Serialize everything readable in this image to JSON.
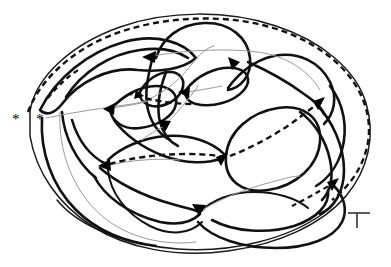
{
  "figure": {
    "caption": "",
    "background_color": "#ffffff",
    "width": 391,
    "height": 267
  },
  "palette": {
    "thick_stroke": "#111111",
    "thin_stroke": "#9a9a9a",
    "outline_stroke": "#1a1a1a",
    "dashed_stroke": "#111111",
    "arrow_fill": "#000000",
    "marker_color": "#000000",
    "t_marker_color": "#333333"
  },
  "markers": [
    {
      "id": "asterisk-outer-left",
      "label": "*",
      "x": 18,
      "y": 118,
      "size": 15
    },
    {
      "id": "asterisk-inner-left",
      "label": "*",
      "x": 42,
      "y": 118,
      "size": 15
    },
    {
      "id": "asterisk-center",
      "label": "*",
      "x": 133,
      "y": 95,
      "size": 11
    },
    {
      "id": "t-marker-bottom-right",
      "label": "T",
      "x": 352,
      "y": 225,
      "size": 14
    }
  ],
  "arrowheads": [
    {
      "id": "node-upper-left",
      "x": 152,
      "y": 57,
      "angle": 196,
      "size": 9
    },
    {
      "id": "node-upper-right",
      "x": 239,
      "y": 65,
      "angle": 330,
      "size": 9
    },
    {
      "id": "node-mid-right",
      "x": 186,
      "y": 92,
      "angle": 188,
      "size": 8
    },
    {
      "id": "node-mid-left",
      "x": 111,
      "y": 108,
      "angle": 192,
      "size": 8
    },
    {
      "id": "node-center-asterisk",
      "x": 139,
      "y": 94,
      "angle": 150,
      "size": 7
    },
    {
      "id": "node-center-down",
      "x": 165,
      "y": 126,
      "angle": 78,
      "size": 8
    },
    {
      "id": "node-right-upper",
      "x": 322,
      "y": 100,
      "angle": 318,
      "size": 9
    },
    {
      "id": "node-left-lower",
      "x": 106,
      "y": 165,
      "angle": 205,
      "size": 9
    },
    {
      "id": "node-center-lower",
      "x": 224,
      "y": 157,
      "angle": 335,
      "size": 9
    },
    {
      "id": "node-bottom-center",
      "x": 199,
      "y": 210,
      "angle": 62,
      "size": 9
    },
    {
      "id": "node-bottom-right",
      "x": 337,
      "y": 181,
      "angle": 318,
      "size": 9
    }
  ],
  "strokes": {
    "outer_boundary": "large closed oval enclosing the whole figure",
    "dashed_path": "loops from left asterisks over the top, down the right side, through the centre and back toward the lower right",
    "lobe_count": 12,
    "thin_line_count": 7
  },
  "legend": {
    "thick_label": "",
    "thin_label": "",
    "dashed_label": ""
  }
}
